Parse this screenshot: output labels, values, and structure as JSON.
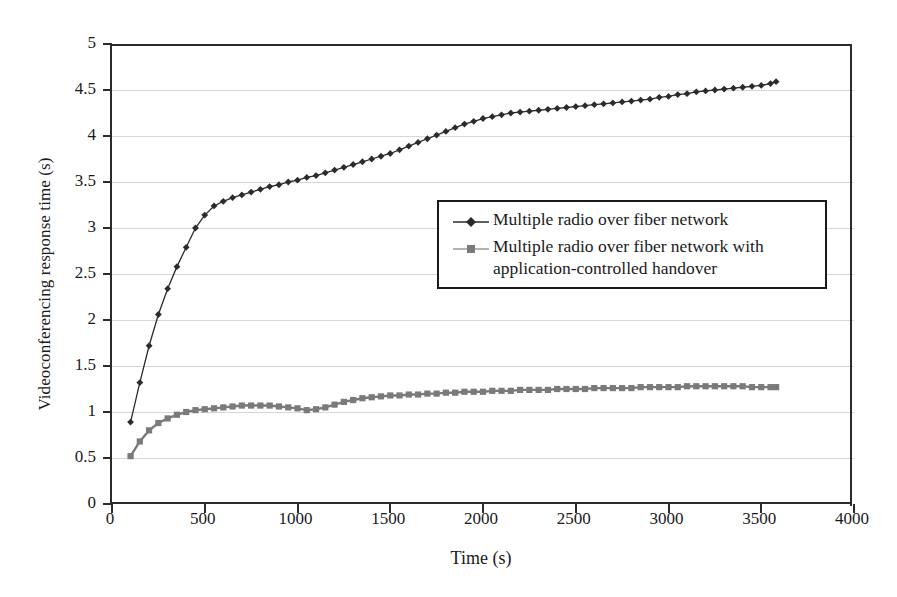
{
  "chart_data": {
    "type": "line",
    "title": "",
    "xlabel": "Time (s)",
    "ylabel": "Videoconferencing response time (s)",
    "xlim": [
      0,
      4000
    ],
    "ylim": [
      0,
      5
    ],
    "xticks": [
      0,
      500,
      1000,
      1500,
      2000,
      2500,
      3000,
      3500,
      4000
    ],
    "yticks": [
      0,
      0.5,
      1,
      1.5,
      2,
      2.5,
      3,
      3.5,
      4,
      4.5,
      5
    ],
    "xtick_labels": [
      "0",
      "500",
      "1000",
      "1500",
      "2000",
      "2500",
      "3000",
      "3500",
      "4000"
    ],
    "ytick_labels": [
      "0",
      "0.5",
      "1",
      "1.5",
      "2",
      "2.5",
      "3",
      "3.5",
      "4",
      "4.5",
      "5"
    ],
    "grid": "horizontal",
    "grid_color": "#d6d6d6",
    "legend_position": "center-right",
    "series": [
      {
        "name": "Multiple radio over fiber network",
        "color": "#2b2b2b",
        "marker": "diamond",
        "x": [
          100,
          150,
          200,
          250,
          300,
          350,
          400,
          450,
          500,
          550,
          600,
          650,
          700,
          750,
          800,
          850,
          900,
          950,
          1000,
          1050,
          1100,
          1150,
          1200,
          1250,
          1300,
          1350,
          1400,
          1450,
          1500,
          1550,
          1600,
          1650,
          1700,
          1750,
          1800,
          1850,
          1900,
          1950,
          2000,
          2050,
          2100,
          2150,
          2200,
          2250,
          2300,
          2350,
          2400,
          2450,
          2500,
          2550,
          2600,
          2650,
          2700,
          2750,
          2800,
          2850,
          2900,
          2950,
          3000,
          3050,
          3100,
          3150,
          3200,
          3250,
          3300,
          3350,
          3400,
          3450,
          3500,
          3550,
          3580
        ],
        "y": [
          0.89,
          1.32,
          1.72,
          2.06,
          2.34,
          2.58,
          2.79,
          3.0,
          3.14,
          3.24,
          3.29,
          3.33,
          3.36,
          3.39,
          3.42,
          3.45,
          3.47,
          3.5,
          3.52,
          3.55,
          3.57,
          3.6,
          3.63,
          3.66,
          3.69,
          3.72,
          3.75,
          3.78,
          3.81,
          3.85,
          3.89,
          3.93,
          3.97,
          4.01,
          4.05,
          4.09,
          4.13,
          4.16,
          4.19,
          4.21,
          4.23,
          4.25,
          4.26,
          4.27,
          4.28,
          4.29,
          4.3,
          4.31,
          4.32,
          4.33,
          4.34,
          4.35,
          4.36,
          4.37,
          4.38,
          4.39,
          4.4,
          4.42,
          4.43,
          4.45,
          4.46,
          4.48,
          4.49,
          4.5,
          4.51,
          4.52,
          4.53,
          4.54,
          4.55,
          4.57,
          4.59
        ]
      },
      {
        "name": "Multiple radio over fiber network with application-controlled handover",
        "color": "#7a7a7a",
        "marker": "square",
        "x": [
          100,
          150,
          200,
          250,
          300,
          350,
          400,
          450,
          500,
          550,
          600,
          650,
          700,
          750,
          800,
          850,
          900,
          950,
          1000,
          1050,
          1100,
          1150,
          1200,
          1250,
          1300,
          1350,
          1400,
          1450,
          1500,
          1550,
          1600,
          1650,
          1700,
          1750,
          1800,
          1850,
          1900,
          1950,
          2000,
          2050,
          2100,
          2150,
          2200,
          2250,
          2300,
          2350,
          2400,
          2450,
          2500,
          2550,
          2600,
          2650,
          2700,
          2750,
          2800,
          2850,
          2900,
          2950,
          3000,
          3050,
          3100,
          3150,
          3200,
          3250,
          3300,
          3350,
          3400,
          3450,
          3500,
          3550,
          3580
        ],
        "y": [
          0.52,
          0.68,
          0.8,
          0.88,
          0.93,
          0.97,
          1.0,
          1.02,
          1.03,
          1.04,
          1.05,
          1.06,
          1.07,
          1.07,
          1.07,
          1.07,
          1.06,
          1.05,
          1.04,
          1.02,
          1.03,
          1.05,
          1.08,
          1.11,
          1.13,
          1.15,
          1.16,
          1.17,
          1.18,
          1.18,
          1.19,
          1.19,
          1.2,
          1.2,
          1.21,
          1.21,
          1.22,
          1.22,
          1.22,
          1.23,
          1.23,
          1.23,
          1.24,
          1.24,
          1.24,
          1.24,
          1.25,
          1.25,
          1.25,
          1.25,
          1.26,
          1.26,
          1.26,
          1.26,
          1.26,
          1.27,
          1.27,
          1.27,
          1.27,
          1.27,
          1.28,
          1.28,
          1.28,
          1.28,
          1.28,
          1.28,
          1.28,
          1.27,
          1.27,
          1.27,
          1.27
        ]
      }
    ]
  },
  "legend": {
    "entries": [
      {
        "label": "Multiple radio over fiber network",
        "marker": "diamond",
        "color": "#2b2b2b"
      },
      {
        "label": "Multiple radio over fiber network with\napplication-controlled handover",
        "marker": "square",
        "color": "#7a7a7a"
      }
    ]
  }
}
